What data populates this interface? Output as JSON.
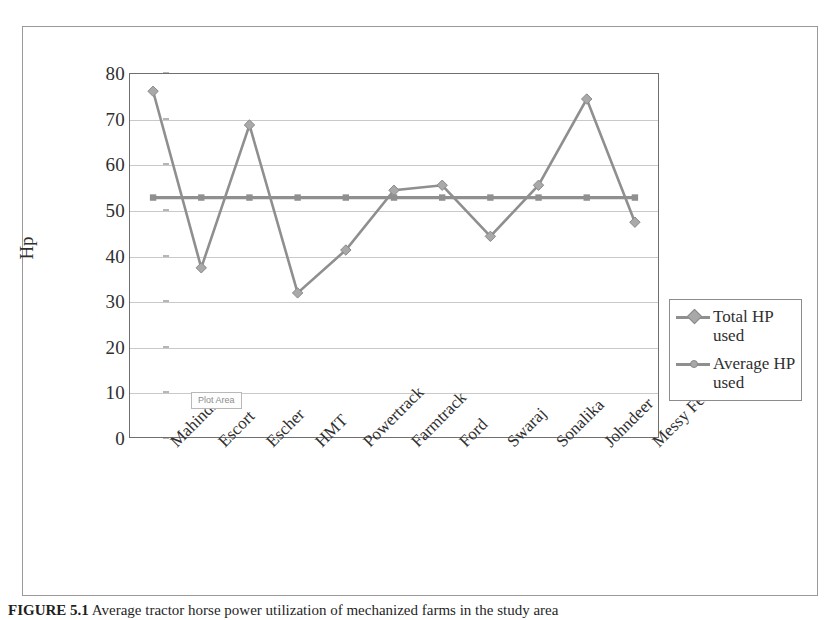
{
  "figure": {
    "caption_label": "FIGURE 5.1",
    "caption_text": "Average tractor horse power utilization of mechanized farms in the study area"
  },
  "plot_area_tooltip": "Plot Area",
  "axes": {
    "y_title": "Hp",
    "y_ticks": [
      "0",
      "10",
      "20",
      "30",
      "40",
      "50",
      "60",
      "70",
      "80"
    ]
  },
  "legend": {
    "entries": [
      {
        "label": "Total HP used",
        "marker": "diamond-marker",
        "color": "#8f8f8f"
      },
      {
        "label": "Average HP used",
        "marker": "square-marker",
        "color": "#8f8f8f"
      }
    ]
  },
  "chart_data": {
    "type": "line",
    "title": "",
    "xlabel": "",
    "ylabel": "Hp",
    "ylim": [
      0,
      80
    ],
    "ytick_step": 10,
    "grid": true,
    "legend_position": "right",
    "categories": [
      "Mahindra",
      "Escort",
      "Escher",
      "HMT",
      "Powertrack",
      "Farmtrack",
      "Ford",
      "Swaraj",
      "Sonalika",
      "Johndeer",
      "Messy Ferguson"
    ],
    "series": [
      {
        "name": "Total HP used",
        "color": "#8f8f8f",
        "marker": "diamond",
        "values": [
          76.0,
          37.3,
          68.6,
          31.8,
          41.2,
          54.3,
          55.4,
          44.2,
          55.4,
          74.3,
          47.3
        ]
      },
      {
        "name": "Average HP used",
        "color": "#8f8f8f",
        "marker": "square",
        "values": [
          52.7,
          52.7,
          52.7,
          52.7,
          52.7,
          52.7,
          52.7,
          52.7,
          52.7,
          52.7,
          52.7
        ]
      }
    ]
  }
}
